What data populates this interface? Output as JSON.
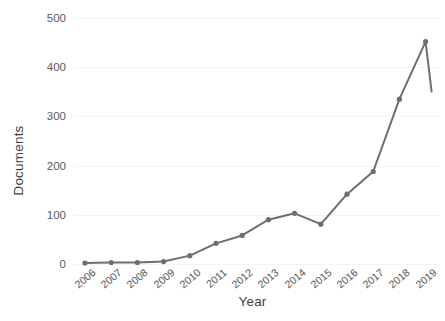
{
  "chart_data": {
    "type": "line",
    "title": "",
    "xlabel": "Year",
    "ylabel": "Documents",
    "categories": [
      "2006",
      "2007",
      "2008",
      "2009",
      "2010",
      "2011",
      "2012",
      "2013",
      "2014",
      "2015",
      "2016",
      "2017",
      "2018",
      "2019"
    ],
    "values": [
      2,
      3,
      3,
      5,
      17,
      42,
      58,
      90,
      103,
      81,
      142,
      188,
      335,
      452
    ],
    "series": [
      {
        "name": "Documents",
        "values": [
          2,
          3,
          3,
          5,
          17,
          42,
          58,
          90,
          103,
          81,
          142,
          188,
          335,
          452
        ]
      }
    ],
    "xlim": [
      2006,
      2019
    ],
    "ylim": [
      0,
      500
    ],
    "yticks": [
      0,
      100,
      200,
      300,
      400,
      500
    ],
    "ytick_labels": [
      "0",
      "100",
      "200",
      "300",
      "400",
      "500"
    ],
    "xtick_labels": [
      "2006",
      "2007",
      "2008",
      "2009",
      "2010",
      "2011",
      "2012",
      "2013",
      "2014",
      "2015",
      "2016",
      "2017",
      "2018",
      "2019"
    ],
    "grid": true,
    "legend": "none",
    "line_color": "#6e6e6e",
    "marker_color": "#6e6e6e",
    "marker": "circle",
    "background": "#ffffff"
  }
}
